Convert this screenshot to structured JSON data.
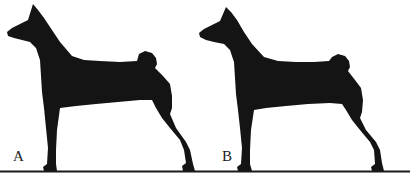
{
  "figure": {
    "panels": [
      {
        "label": "A",
        "subject": "dog silhouette, standing side profile"
      },
      {
        "label": "B",
        "subject": "dog silhouette, standing side profile"
      }
    ],
    "colors": {
      "silhouette": "#141414",
      "ground_line": "#1a1a1a",
      "background": "#ffffff"
    }
  }
}
